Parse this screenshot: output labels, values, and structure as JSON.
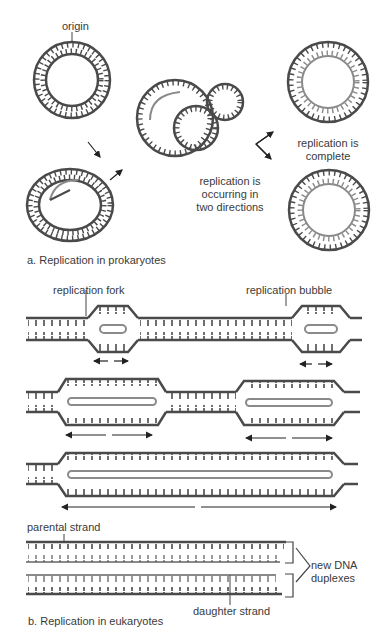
{
  "colors": {
    "strand": "#4a4a4a",
    "daughter": "#8a8a8a",
    "text": "#3a3a3a",
    "background": "#ffffff"
  },
  "panel_a": {
    "caption": "a. Replication in prokaryotes",
    "labels": {
      "origin": "origin",
      "occurring_line1": "replication is",
      "occurring_line2": "occurring in",
      "occurring_line3": "two directions",
      "complete_line1": "replication is",
      "complete_line2": "complete"
    }
  },
  "panel_b": {
    "caption": "b. Replication in eukaryotes",
    "labels": {
      "fork": "replication fork",
      "bubble": "replication bubble",
      "parental": "parental strand",
      "daughter": "daughter strand",
      "duplexes_line1": "new DNA",
      "duplexes_line2": "duplexes"
    }
  }
}
